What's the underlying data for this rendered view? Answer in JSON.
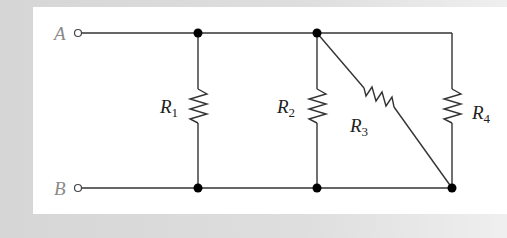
{
  "diagram": {
    "type": "circuit",
    "terminals": [
      {
        "id": "A",
        "label": "A"
      },
      {
        "id": "B",
        "label": "B"
      }
    ],
    "resistors": [
      {
        "id": "R1",
        "letter": "R",
        "sub": "1",
        "between": [
          "A",
          "B"
        ]
      },
      {
        "id": "R2",
        "letter": "R",
        "sub": "2",
        "between": [
          "A",
          "B"
        ]
      },
      {
        "id": "R3",
        "letter": "R",
        "sub": "3",
        "between": [
          "A",
          "B"
        ],
        "orientation": "diagonal"
      },
      {
        "id": "R4",
        "letter": "R",
        "sub": "4",
        "between": [
          "A",
          "B"
        ]
      }
    ],
    "colors": {
      "wire": "#333333",
      "node": "#000000",
      "panel": "#ffffff",
      "background": "#dcdcdc",
      "terminal_label": "#8a8a8a"
    }
  }
}
